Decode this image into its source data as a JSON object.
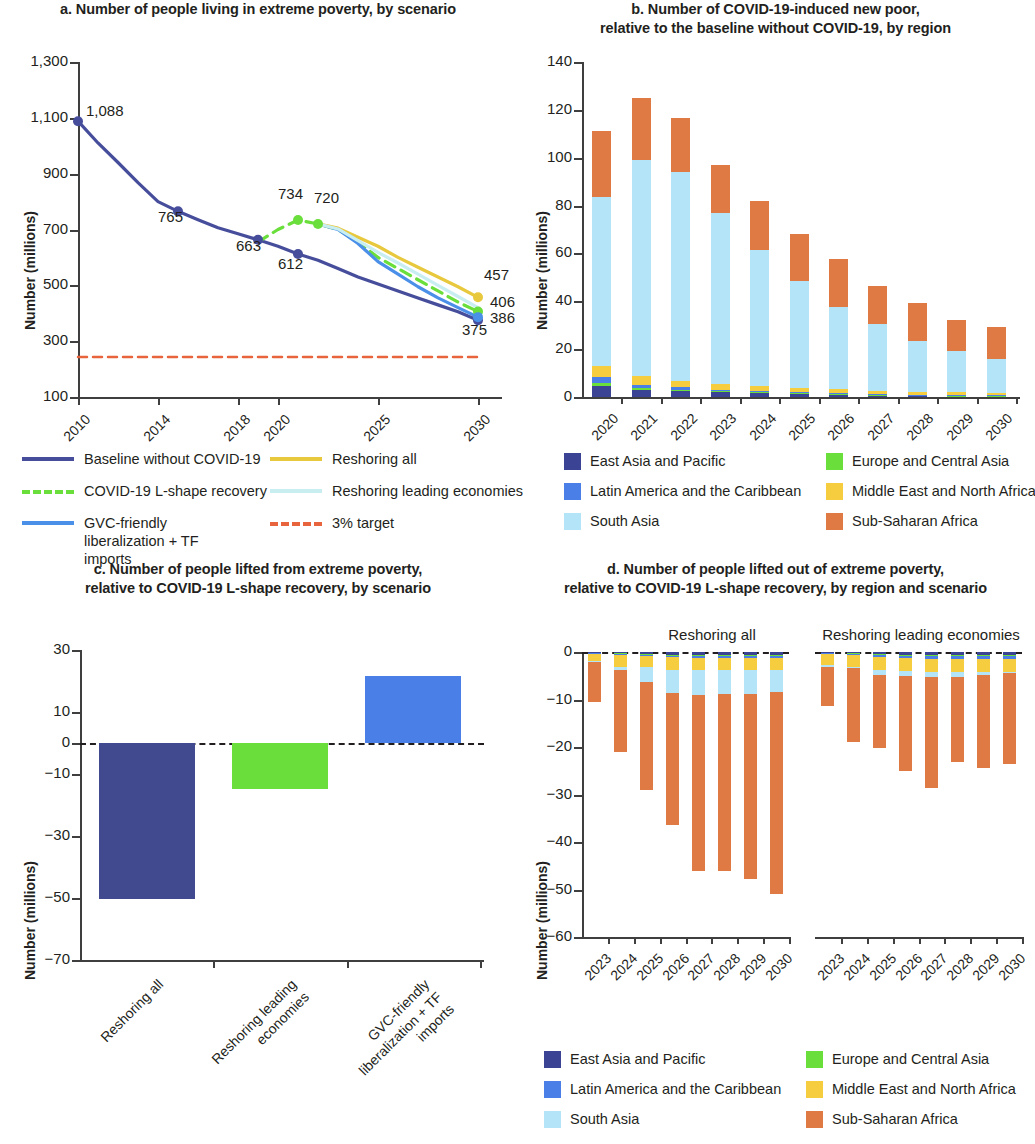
{
  "colors": {
    "east_asia_pacific": "#3b4395",
    "europe_central_asia": "#6ade3a",
    "latin_america_caribbean": "#4a7fe8",
    "middle_east_north_africa": "#f5cd3f",
    "south_asia": "#b3e4f7",
    "sub_saharan_africa": "#e07a44",
    "baseline": "#464d9b",
    "covid_lshape": "#6ade3a",
    "gvc_friendly": "#4a8fe8",
    "reshoring_all": "#e8c83c",
    "reshoring_leading": "#c8eef2",
    "target": "#e8643c",
    "bar_c_reshoring_all": "#414a8f",
    "bar_c_reshoring_leading": "#6ade3a",
    "bar_c_gvc": "#4a7fe8",
    "axis": "#3f3f3f",
    "text": "#231f20"
  },
  "panel_a": {
    "title": "a. Number of people living in extreme poverty, by scenario",
    "chart_data": {
      "type": "line",
      "title": "a. Number of people living in extreme poverty, by scenario",
      "xlabel": "",
      "ylabel": "Number (millions)",
      "ylim": [
        100,
        1300
      ],
      "yticks": [
        100,
        300,
        500,
        700,
        900,
        1100,
        1300
      ],
      "ytick_labels": [
        "100",
        "300",
        "500",
        "700",
        "900",
        "1,100",
        "1,300"
      ],
      "xlim": [
        2010,
        2031
      ],
      "xticks": [
        2010,
        2014,
        2018,
        2020,
        2025,
        2030
      ],
      "xtick_labels": [
        "2010",
        "2014",
        "2018",
        "2020",
        "2025",
        "2030"
      ],
      "grid": false,
      "legend_position": "below",
      "series": [
        {
          "name": "Baseline without COVID-19",
          "color": "#464d9b",
          "style": "solid",
          "x": [
            2010,
            2011,
            2012,
            2013,
            2014,
            2015,
            2016,
            2017,
            2018,
            2019,
            2020,
            2021,
            2022,
            2023,
            2024,
            2025,
            2026,
            2027,
            2028,
            2029,
            2030
          ],
          "values": [
            1088,
            1010,
            940,
            868,
            800,
            765,
            735,
            706,
            685,
            663,
            640,
            612,
            590,
            560,
            530,
            505,
            480,
            455,
            430,
            405,
            375
          ]
        },
        {
          "name": "COVID-19 L-shape recovery",
          "color": "#6ade3a",
          "style": "dashed",
          "x": [
            2019,
            2020,
            2021,
            2022,
            2023,
            2024,
            2025,
            2026,
            2027,
            2028,
            2029,
            2030
          ],
          "values": [
            655,
            700,
            734,
            720,
            700,
            655,
            600,
            560,
            520,
            480,
            440,
            406
          ]
        },
        {
          "name": "GVC-friendly liberalization + TF imports",
          "color": "#4a8fe8",
          "style": "solid",
          "x": [
            2022,
            2023,
            2024,
            2025,
            2026,
            2027,
            2028,
            2029,
            2030
          ],
          "values": [
            720,
            700,
            650,
            585,
            540,
            495,
            455,
            420,
            386
          ]
        },
        {
          "name": "Reshoring all",
          "color": "#e8c83c",
          "style": "solid",
          "x": [
            2022,
            2023,
            2024,
            2025,
            2026,
            2027,
            2028,
            2029,
            2030
          ],
          "values": [
            720,
            705,
            672,
            640,
            600,
            565,
            530,
            495,
            457
          ]
        },
        {
          "name": "Reshoring leading economies",
          "color": "#c8eef2",
          "style": "solid",
          "x": [
            2022,
            2023,
            2024,
            2025,
            2026,
            2027,
            2028,
            2029,
            2030
          ],
          "values": [
            720,
            702,
            660,
            618,
            580,
            540,
            500,
            460,
            420
          ]
        },
        {
          "name": "3% target",
          "color": "#e8643c",
          "style": "dashed",
          "x": [
            2010,
            2030
          ],
          "values": [
            243,
            243
          ]
        }
      ],
      "point_labels": [
        {
          "text": "1,088",
          "x": 2010,
          "y": 1088
        },
        {
          "text": "765",
          "x": 2015,
          "y": 765
        },
        {
          "text": "663",
          "x": 2019,
          "y": 663
        },
        {
          "text": "612",
          "x": 2021,
          "y": 612
        },
        {
          "text": "734",
          "x": 2021,
          "y": 734
        },
        {
          "text": "720",
          "x": 2022,
          "y": 720
        },
        {
          "text": "457",
          "x": 2030,
          "y": 457
        },
        {
          "text": "406",
          "x": 2030,
          "y": 406
        },
        {
          "text": "386",
          "x": 2030,
          "y": 386
        },
        {
          "text": "375",
          "x": 2030,
          "y": 375
        }
      ]
    },
    "legend": [
      {
        "label": "Baseline without COVID-19",
        "color": "#464d9b",
        "style": "solid"
      },
      {
        "label": "Reshoring all",
        "color": "#e8c83c",
        "style": "solid"
      },
      {
        "label": "COVID-19 L-shape recovery",
        "color": "#6ade3a",
        "style": "dashed"
      },
      {
        "label": "Reshoring leading economies",
        "color": "#c8eef2",
        "style": "solid"
      },
      {
        "label": "GVC-friendly liberalization + TF imports",
        "color": "#4a8fe8",
        "style": "solid"
      },
      {
        "label": "3% target",
        "color": "#e8643c",
        "style": "dashed"
      }
    ]
  },
  "panel_b": {
    "title_line1": "b. Number of COVID-19-induced new poor,",
    "title_line2": "relative to the baseline without COVID-19, by region",
    "chart_data": {
      "type": "bar",
      "subtype": "stacked",
      "title": "b. Number of COVID-19-induced new poor, relative to the baseline without COVID-19, by region",
      "xlabel": "",
      "ylabel": "Number (millions)",
      "ylim": [
        0,
        140
      ],
      "yticks": [
        0,
        20,
        40,
        60,
        80,
        100,
        120,
        140
      ],
      "categories": [
        "2020",
        "2021",
        "2022",
        "2023",
        "2024",
        "2025",
        "2026",
        "2027",
        "2028",
        "2029",
        "2030"
      ],
      "grid": false,
      "legend_position": "below",
      "series": [
        {
          "name": "East Asia and Pacific",
          "color": "#3b4395",
          "values": [
            4.6,
            3.1,
            2.7,
            2.0,
            1.8,
            1.4,
            1.1,
            0.8,
            0.6,
            0.5,
            0.4
          ]
        },
        {
          "name": "Europe and Central Asia",
          "color": "#6ade3a",
          "values": [
            1.1,
            0.5,
            0.4,
            0.3,
            0.2,
            0.2,
            0.2,
            0.1,
            0.1,
            0.1,
            0.1
          ]
        },
        {
          "name": "Latin America and the Caribbean",
          "color": "#4a7fe8",
          "values": [
            2.5,
            1.6,
            1.1,
            0.8,
            0.6,
            0.4,
            0.4,
            0.3,
            0.2,
            0.2,
            0.2
          ]
        },
        {
          "name": "Middle East and North Africa",
          "color": "#f5cd3f",
          "values": [
            4.6,
            3.5,
            2.6,
            2.2,
            1.9,
            1.6,
            1.5,
            1.3,
            1.2,
            1.1,
            1.0
          ]
        },
        {
          "name": "South Asia",
          "color": "#b3e4f7",
          "values": [
            70.8,
            90.4,
            87.4,
            71.7,
            56.8,
            44.9,
            34.6,
            27.8,
            21.1,
            17.3,
            14.0
          ]
        },
        {
          "name": "Sub-Saharan Africa",
          "color": "#e07a44",
          "values": [
            27.5,
            25.9,
            22.4,
            20.0,
            20.8,
            19.8,
            20.0,
            15.9,
            16.2,
            12.9,
            13.4
          ]
        }
      ],
      "totals": [
        111.1,
        125.0,
        116.6,
        97.0,
        82.1,
        68.3,
        57.8,
        46.2,
        39.4,
        32.1,
        29.1
      ]
    },
    "legend": [
      {
        "label": "East Asia and Pacific",
        "color": "#3b4395"
      },
      {
        "label": "Europe and Central Asia",
        "color": "#6ade3a"
      },
      {
        "label": "Latin America and the Caribbean",
        "color": "#4a7fe8"
      },
      {
        "label": "Middle East and North Africa",
        "color": "#f5cd3f"
      },
      {
        "label": "South Asia",
        "color": "#b3e4f7"
      },
      {
        "label": "Sub-Saharan Africa",
        "color": "#e07a44"
      }
    ]
  },
  "panel_c": {
    "title_line1": "c. Number of people lifted from extreme poverty,",
    "title_line2": "relative to COVID-19 L-shape recovery, by scenario",
    "chart_data": {
      "type": "bar",
      "title": "c. Number of people lifted from extreme poverty, relative to COVID-19 L-shape recovery, by scenario",
      "xlabel": "",
      "ylabel": "Number (millions)",
      "ylim": [
        -70,
        30
      ],
      "yticks": [
        -70,
        -50,
        -30,
        -10,
        0,
        10,
        30
      ],
      "ytick_labels": [
        "−70",
        "−50",
        "−30",
        "−10",
        "0",
        "10",
        "30"
      ],
      "categories": [
        "Reshoring all",
        "Reshoring leading economies",
        "GVC-friendly liberalization + TF imports"
      ],
      "values": [
        -50.3,
        -14.7,
        21.5
      ],
      "colors": [
        "#414a8f",
        "#6ade3a",
        "#4a7fe8"
      ],
      "grid": false,
      "zero_line": true
    }
  },
  "panel_d": {
    "title_line1": "d. Number of people lifted out of extreme poverty,",
    "title_line2": "relative to COVID-19 L-shape recovery, by region and scenario",
    "group_labels": [
      "Reshoring all",
      "Reshoring leading economies"
    ],
    "chart_data": {
      "type": "bar",
      "subtype": "stacked-negative",
      "title": "d. Number of people lifted out of extreme poverty, relative to COVID-19 L-shape recovery, by region and scenario",
      "xlabel": "",
      "ylabel": "Number (millions)",
      "ylim": [
        -60,
        0
      ],
      "yticks": [
        0,
        -10,
        -20,
        -30,
        -40,
        -50,
        -60
      ],
      "ytick_labels": [
        "0",
        "−10",
        "−20",
        "−30",
        "−40",
        "−50",
        "−60"
      ],
      "categories": [
        "2023",
        "2024",
        "2025",
        "2026",
        "2027",
        "2028",
        "2029",
        "2030"
      ],
      "grid": false,
      "legend_position": "below",
      "groups": [
        {
          "name": "Reshoring all",
          "series": [
            {
              "name": "East Asia and Pacific",
              "color": "#3b4395",
              "values": [
                -0.15,
                -0.3,
                -0.45,
                -0.6,
                -0.7,
                -0.7,
                -0.7,
                -0.7
              ]
            },
            {
              "name": "Europe and Central Asia",
              "color": "#6ade3a",
              "values": [
                -0.1,
                -0.1,
                -0.15,
                -0.15,
                -0.15,
                -0.15,
                -0.15,
                -0.15
              ]
            },
            {
              "name": "Latin America and the Caribbean",
              "color": "#4a7fe8",
              "values": [
                -0.1,
                -0.2,
                -0.3,
                -0.4,
                -0.4,
                -0.4,
                -0.4,
                -0.4
              ]
            },
            {
              "name": "Middle East and North Africa",
              "color": "#f5cd3f",
              "values": [
                -1.6,
                -2.6,
                -2.3,
                -2.7,
                -2.6,
                -2.6,
                -2.6,
                -2.6
              ]
            },
            {
              "name": "South Asia",
              "color": "#b3e4f7",
              "values": [
                -0.1,
                -0.5,
                -3.1,
                -4.7,
                -5.2,
                -5.0,
                -5.0,
                -4.6
              ]
            },
            {
              "name": "Sub-Saharan Africa",
              "color": "#e07a44",
              "values": [
                -8.4,
                -17.3,
                -22.8,
                -27.9,
                -37.0,
                -37.2,
                -38.9,
                -42.6
              ]
            }
          ],
          "totals": [
            -10.45,
            -21.0,
            -29.1,
            -36.45,
            -46.05,
            -46.05,
            -47.75,
            -51.05
          ]
        },
        {
          "name": "Reshoring leading economies",
          "series": [
            {
              "name": "East Asia and Pacific",
              "color": "#3b4395",
              "values": [
                -0.15,
                -0.25,
                -0.5,
                -0.6,
                -0.7,
                -0.6,
                -0.6,
                -0.6
              ]
            },
            {
              "name": "Europe and Central Asia",
              "color": "#6ade3a",
              "values": [
                -0.1,
                -0.1,
                -0.1,
                -0.15,
                -0.15,
                -0.15,
                -0.15,
                -0.15
              ]
            },
            {
              "name": "Latin America and the Caribbean",
              "color": "#4a7fe8",
              "values": [
                -0.15,
                -0.25,
                -0.5,
                -0.6,
                -0.7,
                -0.7,
                -0.7,
                -0.7
              ]
            },
            {
              "name": "Middle East and North Africa",
              "color": "#f5cd3f",
              "values": [
                -2.4,
                -2.5,
                -2.6,
                -2.7,
                -2.7,
                -2.7,
                -2.7,
                -2.7
              ]
            },
            {
              "name": "South Asia",
              "color": "#b3e4f7",
              "values": [
                -0.3,
                -0.3,
                -1.2,
                -1.1,
                -1.1,
                -1.1,
                -0.7,
                -0.3
              ]
            },
            {
              "name": "Sub-Saharan Africa",
              "color": "#e07a44",
              "values": [
                -8.3,
                -15.6,
                -15.3,
                -19.8,
                -23.3,
                -18.0,
                -19.5,
                -19.2
              ]
            }
          ],
          "totals": [
            -11.4,
            -19.0,
            -20.2,
            -24.95,
            -28.65,
            -23.25,
            -24.35,
            -23.65
          ]
        }
      ]
    },
    "legend": [
      {
        "label": "East Asia and Pacific",
        "color": "#3b4395"
      },
      {
        "label": "Europe and Central Asia",
        "color": "#6ade3a"
      },
      {
        "label": "Latin America and the Caribbean",
        "color": "#4a7fe8"
      },
      {
        "label": "Middle East and North Africa",
        "color": "#f5cd3f"
      },
      {
        "label": "South Asia",
        "color": "#b3e4f7"
      },
      {
        "label": "Sub-Saharan Africa",
        "color": "#e07a44"
      }
    ]
  }
}
